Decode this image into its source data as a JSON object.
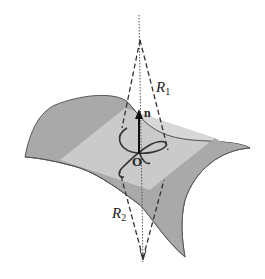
{
  "diagram": {
    "labels": {
      "r1": "R",
      "r1_sub": "1",
      "r2": "R",
      "r2_sub": "2",
      "normal": "n",
      "origin": "O"
    },
    "colors": {
      "surface": "#a9a9a9",
      "tangent_plane": "#d0d0d0",
      "outline": "#555555",
      "curve": "#333333",
      "dashed": "#333333",
      "axis": "#555555",
      "arrow": "#111111"
    }
  }
}
